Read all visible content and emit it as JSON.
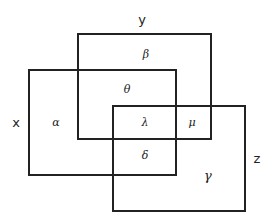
{
  "diagram": {
    "type": "venn-rectangles",
    "stroke_color": "#222222",
    "sets": [
      {
        "id": "y",
        "label": "y",
        "rect": {
          "x": 78,
          "y": 34,
          "w": 133,
          "h": 105
        }
      },
      {
        "id": "x",
        "label": "x",
        "rect": {
          "x": 29,
          "y": 70,
          "w": 147,
          "h": 105
        }
      },
      {
        "id": "z",
        "label": "z",
        "rect": {
          "x": 113,
          "y": 106,
          "w": 132,
          "h": 105
        }
      }
    ],
    "regions": [
      {
        "id": "alpha",
        "label": "α",
        "sets": [
          "x"
        ]
      },
      {
        "id": "beta",
        "label": "β",
        "sets": [
          "y"
        ]
      },
      {
        "id": "theta",
        "label": "θ",
        "sets": [
          "x",
          "y"
        ]
      },
      {
        "id": "lambda",
        "label": "λ",
        "sets": [
          "x",
          "y",
          "z"
        ]
      },
      {
        "id": "mu",
        "label": "μ",
        "sets": [
          "y",
          "z"
        ]
      },
      {
        "id": "delta",
        "label": "δ",
        "sets": [
          "x",
          "z"
        ]
      },
      {
        "id": "gamma",
        "label": "γ",
        "sets": [
          "z"
        ]
      }
    ]
  }
}
